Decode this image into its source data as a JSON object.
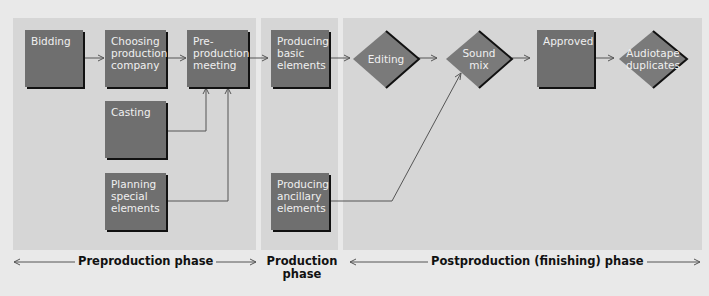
{
  "phases": [
    {
      "label": "Preproduction phase"
    },
    {
      "label": "Production",
      "label2": "phase"
    },
    {
      "label": "Postproduction (finishing) phase"
    }
  ],
  "nodes": {
    "bidding": "Bidding",
    "choosing": [
      "Choosing",
      "production",
      "company"
    ],
    "preproduction_meeting": [
      "Pre-",
      "production",
      "meeting"
    ],
    "casting": "Casting",
    "planning": [
      "Planning",
      "special",
      "elements"
    ],
    "producing_basic": [
      "Producing",
      "basic",
      "elements"
    ],
    "producing_ancillary": [
      "Producing",
      "ancillary",
      "elements"
    ],
    "editing": "Editing",
    "sound_mix": [
      "Sound",
      "mix"
    ],
    "approved": "Approved",
    "audiotape": [
      "Audiotape",
      "duplicates"
    ]
  },
  "colors": {
    "box": "#6f6f6f",
    "panel": "#d6d6d6",
    "background": "#e9e9e9"
  }
}
